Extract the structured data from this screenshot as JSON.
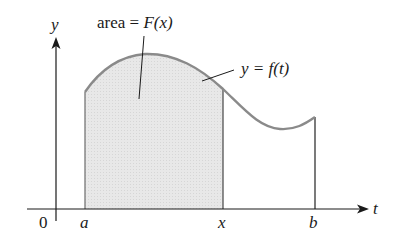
{
  "diagram": {
    "type": "area-under-curve",
    "axes": {
      "y_label": "y",
      "x_label": "t",
      "origin_label": "0"
    },
    "ticks": [
      {
        "label": "a",
        "x": 85
      },
      {
        "label": "x",
        "x": 223
      },
      {
        "label": "b",
        "x": 315
      }
    ],
    "annotations": {
      "area_label_prefix": "area = ",
      "area_label_func": "F(x)",
      "curve_label": "y = f(t)"
    },
    "colors": {
      "curve": "#8a8a8a",
      "fill": "#e6e6e6",
      "axis": "#1a1a1a",
      "vertical_lines": "#555555"
    }
  }
}
